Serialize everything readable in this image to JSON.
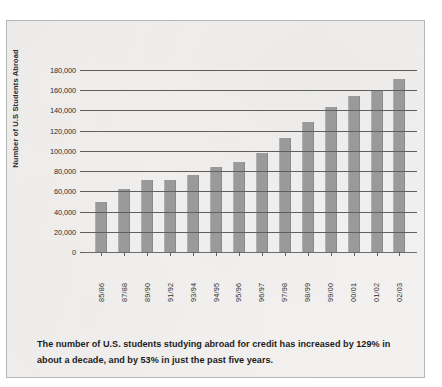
{
  "chart_data": {
    "type": "bar",
    "title": "",
    "xlabel": "",
    "ylabel": "Number of U.S Students Abroad",
    "ylim": [
      0,
      180000
    ],
    "grid": true,
    "legend": "none",
    "categories": [
      "85/86",
      "87/88",
      "89/90",
      "91/92",
      "93/94",
      "94/95",
      "95/96",
      "96/97",
      "97/98",
      "98/99",
      "99/00",
      "00/01",
      "01/02",
      "02/03"
    ],
    "values": [
      49000,
      62000,
      71000,
      71500,
      76000,
      84000,
      89000,
      98000,
      113000,
      129000,
      143000,
      154000,
      160000,
      171000
    ],
    "ytick_labels": [
      "180,000",
      "160,000",
      "140,000",
      "120,000",
      "100,000",
      "80,000",
      "60,000",
      "40,000",
      "20,000",
      "0"
    ],
    "ytick_values": [
      180000,
      160000,
      140000,
      120000,
      100000,
      80000,
      60000,
      40000,
      20000,
      0
    ],
    "bar_color": "#9a9a9a",
    "axis_color": "#5f5f5f"
  },
  "caption": {
    "text": "The number of U.S. students studying abroad for credit has increased by 129% in about a decade, and by 53% in just the past five years."
  }
}
